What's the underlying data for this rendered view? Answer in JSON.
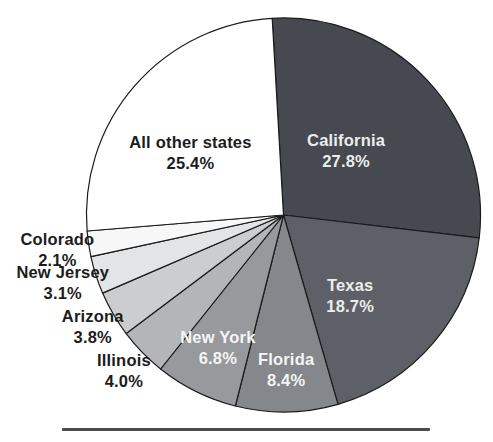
{
  "chart_data": {
    "type": "pie",
    "title": "",
    "unit": "%",
    "legend_position": "none",
    "outline_color": "#1b1b1b",
    "background": "#ffffff",
    "slices": [
      {
        "label": "California",
        "value": 27.8,
        "pct_label": "27.8%",
        "color": "#46494f",
        "label_color": "#eceded",
        "label_r": 0.46,
        "label_angle_offset": -3
      },
      {
        "label": "Texas",
        "value": 18.7,
        "pct_label": "18.7%",
        "color": "#5d6066",
        "label_color": "#eceded",
        "label_r": 0.53,
        "label_angle_offset": 10
      },
      {
        "label": "Florida",
        "value": 8.4,
        "pct_label": "8.4%",
        "color": "#84878b",
        "label_color": "#f5f5f5",
        "label_r": 0.78,
        "label_angle_offset": 0
      },
      {
        "label": "New York",
        "value": 6.8,
        "pct_label": "6.8%",
        "color": "#97999c",
        "label_color": "#f5f5f5",
        "label_r": 0.75,
        "label_angle_offset": 0
      },
      {
        "label": "Illinois",
        "value": 4.0,
        "pct_label": "4.0%",
        "color": "#b3b5b7",
        "label_color": "#1c1c1c",
        "label_r": 1.13,
        "label_angle_offset": 0
      },
      {
        "label": "Arizona",
        "value": 3.8,
        "pct_label": "3.8%",
        "color": "#cccdce",
        "label_color": "#1c1c1c",
        "label_r": 1.12,
        "label_angle_offset": 0
      },
      {
        "label": "New Jersey",
        "value": 3.1,
        "pct_label": "3.1%",
        "color": "#e3e4e5",
        "label_color": "#1c1c1c",
        "label_r": 1.17,
        "label_angle_offset": 1
      },
      {
        "label": "Colorado",
        "value": 2.1,
        "pct_label": "2.1%",
        "color": "#f7f7f7",
        "label_color": "#1c1c1c",
        "label_r": 1.16,
        "label_angle_offset": 0
      },
      {
        "label": "All other states",
        "value": 25.4,
        "pct_label": "25.4%",
        "color": "#ffffff",
        "label_color": "#1c1c1c",
        "label_r": 0.57,
        "label_angle_offset": -7
      }
    ]
  },
  "footer": {
    "rule_color": "#4b4b4b"
  }
}
